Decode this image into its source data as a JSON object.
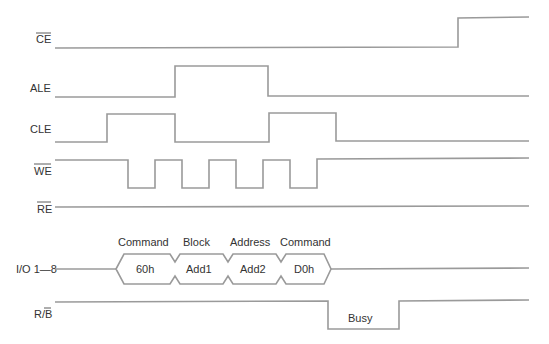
{
  "signals": [
    {
      "name": "CE",
      "label": "CE",
      "overbar": true
    },
    {
      "name": "ALE",
      "label": "ALE",
      "overbar": false
    },
    {
      "name": "CLE",
      "label": "CLE",
      "overbar": false
    },
    {
      "name": "WE",
      "label": "WE",
      "overbar": true
    },
    {
      "name": "RE",
      "label": "RE",
      "overbar": true
    },
    {
      "name": "IO",
      "label": "I/O 1—8",
      "overbar": false
    },
    {
      "name": "RB",
      "label": "R/B",
      "overbar_part": "B"
    }
  ],
  "io_bus": {
    "phases": [
      {
        "header": "Command",
        "value": "60h"
      },
      {
        "header": "Block",
        "value": "Add1"
      },
      {
        "header": "Address",
        "value": "Add2"
      },
      {
        "header": "Command",
        "value": "D0h"
      }
    ]
  },
  "rb": {
    "busy_label": "Busy"
  },
  "colors": {
    "wave": "#9a9a9a",
    "text": "#333333"
  }
}
